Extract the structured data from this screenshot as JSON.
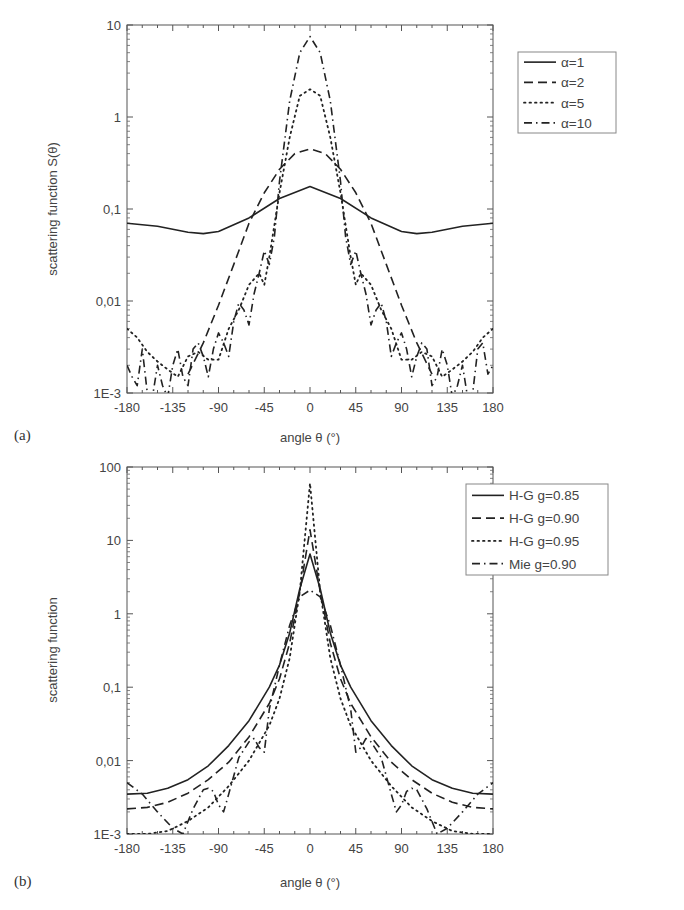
{
  "chart_data": [
    {
      "panel": "(a)",
      "type": "line",
      "title": "",
      "xlabel": "angle θ (°)",
      "ylabel": "scattering function S(θ)",
      "xlim": [
        -180,
        180
      ],
      "ylim": [
        0.001,
        10
      ],
      "yscale": "log",
      "xticks": [
        "-180",
        "-135",
        "-90",
        "-45",
        "0",
        "45",
        "90",
        "135",
        "180"
      ],
      "yticks": [
        "1E-3",
        "0,01",
        "0,1",
        "1",
        "10"
      ],
      "legend_position": "upper right",
      "grid": false,
      "series": [
        {
          "name": "α=1",
          "style": "solid",
          "x": [
            -180,
            -150,
            -120,
            -105,
            -90,
            -60,
            -30,
            0,
            30,
            60,
            90,
            105,
            120,
            150,
            180
          ],
          "y": [
            0.07,
            0.065,
            0.056,
            0.054,
            0.057,
            0.08,
            0.13,
            0.175,
            0.13,
            0.08,
            0.057,
            0.054,
            0.056,
            0.065,
            0.07
          ]
        },
        {
          "name": "α=2",
          "style": "dashed",
          "x": [
            -120,
            -105,
            -90,
            -75,
            -60,
            -45,
            -30,
            -15,
            0,
            15,
            30,
            45,
            60,
            75,
            90,
            105,
            120
          ],
          "y": [
            0.0016,
            0.0035,
            0.009,
            0.025,
            0.07,
            0.15,
            0.27,
            0.4,
            0.45,
            0.4,
            0.27,
            0.15,
            0.07,
            0.025,
            0.009,
            0.0035,
            0.0016
          ]
        },
        {
          "name": "α=5",
          "style": "dotted",
          "x": [
            -180,
            -170,
            -160,
            -150,
            -140,
            -130,
            -120,
            -110,
            -100,
            -90,
            -80,
            -70,
            -60,
            -50,
            -45,
            -40,
            -30,
            -20,
            -10,
            0,
            10,
            20,
            30,
            40,
            45,
            50,
            60,
            70,
            80,
            90,
            100,
            110,
            120,
            130,
            140,
            150,
            160,
            170,
            180
          ],
          "y": [
            0.005,
            0.004,
            0.0028,
            0.0022,
            0.0018,
            0.0015,
            0.0025,
            0.0028,
            0.0023,
            0.0023,
            0.005,
            0.008,
            0.015,
            0.02,
            0.015,
            0.03,
            0.15,
            0.6,
            1.7,
            2.0,
            1.7,
            0.6,
            0.15,
            0.03,
            0.015,
            0.02,
            0.015,
            0.008,
            0.005,
            0.0023,
            0.0023,
            0.0028,
            0.0025,
            0.0015,
            0.0018,
            0.0022,
            0.0028,
            0.004,
            0.005
          ]
        },
        {
          "name": "α=10",
          "style": "dashdot",
          "x": [
            -180,
            -175,
            -170,
            -165,
            -160,
            -155,
            -150,
            -145,
            -140,
            -135,
            -130,
            -125,
            -120,
            -115,
            -110,
            -105,
            -100,
            -95,
            -90,
            -85,
            -80,
            -75,
            -70,
            -65,
            -60,
            -55,
            -50,
            -45,
            -40,
            -35,
            -30,
            -20,
            -10,
            0,
            10,
            20,
            30,
            35,
            40,
            45,
            50,
            55,
            60,
            65,
            70,
            75,
            80,
            85,
            90,
            95,
            100,
            105,
            110,
            115,
            120,
            125,
            130,
            135,
            140,
            145,
            150,
            155,
            160,
            165,
            170,
            175,
            180
          ],
          "y": [
            0.002,
            0.0015,
            0.0012,
            0.003,
            0.001,
            0.0009,
            0.002,
            0.0012,
            0.0009,
            0.002,
            0.003,
            0.0015,
            0.0012,
            0.003,
            0.0035,
            0.0025,
            0.0015,
            0.003,
            0.0045,
            0.0035,
            0.0025,
            0.006,
            0.0095,
            0.008,
            0.0055,
            0.012,
            0.02,
            0.035,
            0.025,
            0.05,
            0.2,
            1.5,
            5.0,
            7.5,
            5.0,
            1.5,
            0.2,
            0.05,
            0.025,
            0.035,
            0.02,
            0.012,
            0.0055,
            0.008,
            0.0095,
            0.006,
            0.0025,
            0.0035,
            0.0045,
            0.003,
            0.0015,
            0.0025,
            0.0035,
            0.003,
            0.0012,
            0.0015,
            0.003,
            0.002,
            0.0009,
            0.0012,
            0.002,
            0.0009,
            0.001,
            0.003,
            0.0035,
            0.0016,
            0.002
          ]
        }
      ]
    },
    {
      "panel": "(b)",
      "type": "line",
      "title": "",
      "xlabel": "angle θ (°)",
      "ylabel": "scattering function",
      "xlim": [
        -180,
        180
      ],
      "ylim": [
        0.001,
        100
      ],
      "yscale": "log",
      "xticks": [
        "-180",
        "-135",
        "-90",
        "-45",
        "0",
        "45",
        "90",
        "135",
        "180"
      ],
      "yticks": [
        "1E-3",
        "0,01",
        "0,1",
        "1",
        "10",
        "100"
      ],
      "legend_position": "upper right",
      "grid": false,
      "series": [
        {
          "name": "H-G  g=0.85",
          "style": "solid",
          "x": [
            -180,
            -160,
            -140,
            -120,
            -100,
            -80,
            -60,
            -40,
            -30,
            -20,
            -10,
            0,
            10,
            20,
            30,
            40,
            60,
            80,
            100,
            120,
            140,
            160,
            180
          ],
          "y": [
            0.0035,
            0.0036,
            0.0042,
            0.0055,
            0.0085,
            0.016,
            0.035,
            0.1,
            0.2,
            0.55,
            2.2,
            6.5,
            2.2,
            0.55,
            0.2,
            0.1,
            0.035,
            0.016,
            0.0085,
            0.0055,
            0.0042,
            0.0036,
            0.0035
          ]
        },
        {
          "name": "H-G  g=0.90",
          "style": "dashed",
          "x": [
            -180,
            -160,
            -140,
            -120,
            -100,
            -80,
            -60,
            -40,
            -30,
            -20,
            -10,
            0,
            10,
            20,
            30,
            40,
            60,
            80,
            100,
            120,
            140,
            160,
            180
          ],
          "y": [
            0.0022,
            0.0023,
            0.0027,
            0.0036,
            0.0055,
            0.0095,
            0.021,
            0.06,
            0.13,
            0.4,
            2.0,
            14.0,
            2.0,
            0.4,
            0.13,
            0.06,
            0.021,
            0.0095,
            0.0055,
            0.0036,
            0.0027,
            0.0023,
            0.0022
          ]
        },
        {
          "name": "H-G  g=0.95",
          "style": "dotted",
          "x": [
            -180,
            -160,
            -140,
            -120,
            -100,
            -80,
            -60,
            -40,
            -30,
            -20,
            -10,
            0,
            10,
            20,
            30,
            40,
            60,
            80,
            100,
            120,
            140,
            160,
            180
          ],
          "y": [
            0.001,
            0.001,
            0.0011,
            0.0015,
            0.0023,
            0.0045,
            0.01,
            0.03,
            0.07,
            0.25,
            2.0,
            60.0,
            2.0,
            0.25,
            0.07,
            0.03,
            0.01,
            0.0045,
            0.0023,
            0.0015,
            0.0011,
            0.001,
            0.001
          ]
        },
        {
          "name": "Mie  g=0.90",
          "style": "dashdot",
          "x": [
            -180,
            -165,
            -150,
            -135,
            -125,
            -115,
            -105,
            -100,
            -95,
            -90,
            -85,
            -80,
            -70,
            -60,
            -55,
            -50,
            -45,
            -40,
            -30,
            -20,
            -10,
            0,
            10,
            20,
            30,
            40,
            45,
            50,
            55,
            60,
            70,
            80,
            85,
            90,
            95,
            100,
            105,
            115,
            125,
            135,
            150,
            165,
            180
          ],
          "y": [
            0.005,
            0.0035,
            0.002,
            0.0012,
            0.001,
            0.0022,
            0.004,
            0.0042,
            0.0038,
            0.0025,
            0.002,
            0.0035,
            0.011,
            0.018,
            0.02,
            0.015,
            0.013,
            0.05,
            0.2,
            0.7,
            1.7,
            2.1,
            1.7,
            0.7,
            0.2,
            0.05,
            0.013,
            0.015,
            0.02,
            0.018,
            0.011,
            0.0035,
            0.002,
            0.0025,
            0.0038,
            0.0042,
            0.004,
            0.0022,
            0.001,
            0.0012,
            0.002,
            0.0035,
            0.005
          ]
        }
      ]
    }
  ],
  "figure": {
    "panel_a_label": "(a)",
    "panel_b_label": "(b)"
  }
}
